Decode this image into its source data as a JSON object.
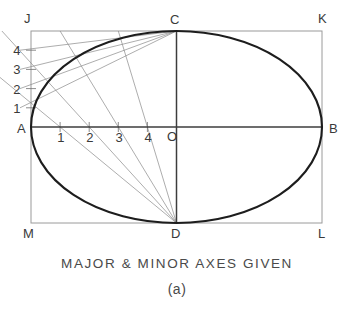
{
  "figure": {
    "caption": "MAJOR & MINOR AXES GIVEN",
    "subcaption": "(a)",
    "colors": {
      "ellipse": "#1d1d1d",
      "construction": "#8a8a8a",
      "axis": "#3d3d3d",
      "rectangle": "#9a9a9a",
      "label": "#3a3a3a",
      "background": "#ffffff"
    },
    "rectangle": {
      "corner_labels": [
        "J",
        "K",
        "L",
        "M"
      ],
      "left": 31,
      "top": 31,
      "right": 322,
      "bottom": 223
    },
    "ellipse": {
      "center_x": 176.5,
      "center_y": 127,
      "semi_major": 145.5,
      "semi_minor": 96
    },
    "points": {
      "A": {
        "label": "A",
        "x": 31,
        "y": 127
      },
      "B": {
        "label": "B",
        "x": 322,
        "y": 127
      },
      "C": {
        "label": "C",
        "x": 176.5,
        "y": 31
      },
      "D": {
        "label": "D",
        "x": 176.5,
        "y": 223
      },
      "O": {
        "label": "O",
        "x": 176.5,
        "y": 127
      },
      "J": {
        "label": "J",
        "x": 31,
        "y": 31
      },
      "K": {
        "label": "K",
        "x": 322,
        "y": 31
      },
      "L": {
        "label": "L",
        "x": 322,
        "y": 223
      },
      "M": {
        "label": "M",
        "x": 31,
        "y": 223
      }
    },
    "vertical_divisions": {
      "labels": [
        "1",
        "2",
        "3",
        "4"
      ],
      "x": 31,
      "y": [
        107.8,
        88.6,
        69.4,
        50.2
      ]
    },
    "horizontal_divisions": {
      "labels": [
        "1",
        "2",
        "3",
        "4"
      ],
      "y": 127,
      "x": [
        60.1,
        89.2,
        118.3,
        147.4
      ]
    },
    "construction": {
      "from_C_label": "C",
      "from_D_label": "D",
      "divisions_count": 4
    }
  }
}
